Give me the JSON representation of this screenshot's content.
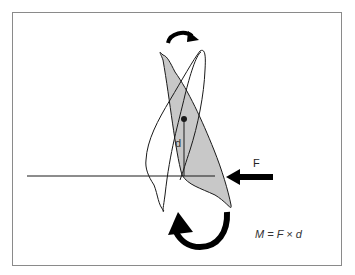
{
  "figure": {
    "type": "biomechanics diagram",
    "labels": {
      "distance": "d",
      "force": "F",
      "equation": "M = F × d"
    },
    "elements": [
      "original-tooth-outline",
      "tipped-tooth-shaded",
      "center-of-resistance-dot",
      "moment-arm-line",
      "occlusal-reference-line",
      "force-arrow",
      "top-rotation-arrow",
      "bottom-rotation-arrow"
    ],
    "colors": {
      "shaded_tooth": "#c8c8c8",
      "outline": "#1a1a1a",
      "border": "#8a8a8a"
    }
  }
}
